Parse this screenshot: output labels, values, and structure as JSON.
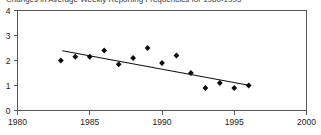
{
  "chart_data": {
    "type": "scatter",
    "title": "Changes in Average Weekly Reporting Frequencies for 1980-1995",
    "xlabel": "",
    "ylabel": "",
    "xlim": [
      1980,
      2000
    ],
    "ylim": [
      0,
      4
    ],
    "xticks": [
      1980,
      1985,
      1990,
      1995,
      2000
    ],
    "yticks": [
      0,
      1,
      2,
      3,
      4
    ],
    "xtick_labels": [
      "1980",
      "1985",
      "1990",
      "1995",
      "2000"
    ],
    "ytick_labels": [
      "0",
      "1",
      "2",
      "3",
      "4"
    ],
    "grid": false,
    "legend": false,
    "marker": "filled-diamond",
    "marker_color": "#0d0d0d",
    "trend_color": "#111111",
    "axis_color": "#55565a",
    "background": "#ffffff",
    "x": [
      1983,
      1984,
      1985,
      1986,
      1987,
      1988,
      1989,
      1990,
      1991,
      1992,
      1993,
      1994,
      1995,
      1996
    ],
    "values": [
      2.0,
      2.15,
      2.15,
      2.4,
      1.85,
      2.1,
      2.5,
      1.9,
      2.2,
      1.5,
      0.9,
      1.1,
      0.9,
      1.0
    ],
    "series": [
      {
        "name": "Average weekly reporting frequency",
        "points": [
          {
            "x": 1983,
            "y": 2.0
          },
          {
            "x": 1984,
            "y": 2.15
          },
          {
            "x": 1985,
            "y": 2.15
          },
          {
            "x": 1986,
            "y": 2.4
          },
          {
            "x": 1987,
            "y": 1.85
          },
          {
            "x": 1988,
            "y": 2.1
          },
          {
            "x": 1989,
            "y": 2.5
          },
          {
            "x": 1990,
            "y": 1.9
          },
          {
            "x": 1991,
            "y": 2.2
          },
          {
            "x": 1992,
            "y": 1.5
          },
          {
            "x": 1993,
            "y": 0.9
          },
          {
            "x": 1994,
            "y": 1.1
          },
          {
            "x": 1995,
            "y": 0.9
          },
          {
            "x": 1996,
            "y": 1.0
          }
        ]
      }
    ],
    "trendline": {
      "type": "linear",
      "x_start": 1983.1,
      "y_start": 2.39,
      "x_end": 1996.1,
      "y_end": 1.0
    }
  }
}
